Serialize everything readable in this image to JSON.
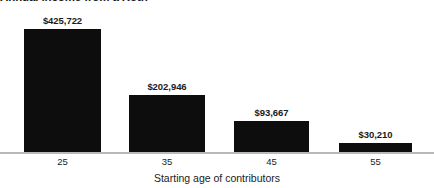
{
  "chart_data": {
    "type": "bar",
    "title": "Annual income from a Roth",
    "title_truncated": true,
    "xlabel": "Starting age of contributors",
    "ylabel": "",
    "categories": [
      "25",
      "35",
      "45",
      "55"
    ],
    "values": [
      425722,
      202946,
      93667,
      30210
    ],
    "value_labels": [
      "$425,722",
      "$202,946",
      "$93,667",
      "$30,210"
    ],
    "ylim": [
      0,
      425722
    ],
    "grid": false,
    "legend": false,
    "bar_color": "#0d0d0d",
    "axis_color": "#b9b9b9",
    "text_color": "#1b1b1b",
    "background_color": "#ffffff",
    "bars": [
      {
        "category": "25",
        "value": 425722,
        "label": "$425,722",
        "left_px": 24,
        "width_px": 77,
        "height_px": 124,
        "center_px": 62.5
      },
      {
        "category": "35",
        "value": 202946,
        "label": "$202,946",
        "left_px": 129,
        "width_px": 76,
        "height_px": 58,
        "center_px": 167
      },
      {
        "category": "45",
        "value": 93667,
        "label": "$93,667",
        "left_px": 234,
        "width_px": 75,
        "height_px": 32,
        "center_px": 271.5
      },
      {
        "category": "55",
        "value": 30210,
        "label": "$30,210",
        "left_px": 339,
        "width_px": 73,
        "height_px": 10,
        "center_px": 375.5
      }
    ]
  }
}
